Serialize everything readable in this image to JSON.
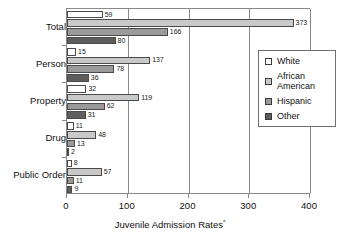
{
  "chart_data": {
    "type": "bar",
    "orientation": "horizontal",
    "title": "",
    "xlabel": "Juvenile Admission Rates",
    "xlabel_footnote": "*",
    "ylabel": "",
    "xlim": [
      0,
      400
    ],
    "xticks": [
      0,
      100,
      200,
      300,
      400
    ],
    "xtick_labels": [
      "0",
      "100",
      "200",
      "300",
      "400"
    ],
    "grid": true,
    "grid_axis": "x",
    "legend_position": "right",
    "categories": [
      "Total",
      "Person",
      "Property",
      "Drug",
      "Public Order"
    ],
    "series": [
      {
        "name": "White",
        "color": "#ffffff",
        "values": [
          59,
          15,
          32,
          11,
          8
        ]
      },
      {
        "name": "African American",
        "color": "#c9c9c9",
        "values": [
          373,
          137,
          119,
          48,
          57
        ]
      },
      {
        "name": "Hispanic",
        "color": "#9a9a9a",
        "values": [
          166,
          78,
          62,
          13,
          11
        ]
      },
      {
        "name": "Other",
        "color": "#5e5e5e",
        "values": [
          80,
          36,
          31,
          2,
          9
        ]
      }
    ]
  },
  "legend": {
    "entries": [
      {
        "label": "White"
      },
      {
        "label": "African\nAmerican"
      },
      {
        "label": "Hispanic"
      },
      {
        "label": "Other"
      }
    ]
  }
}
